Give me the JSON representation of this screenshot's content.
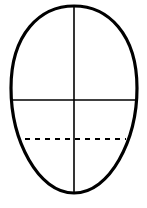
{
  "diagram": {
    "shape": "egg-oval",
    "colors": {
      "stroke": "#000000",
      "background": "#ffffff"
    },
    "outline": {
      "top_y": 6,
      "bottom_y": 193,
      "left_x": 11,
      "right_x": 137,
      "stroke_width": 3.2
    },
    "guides": {
      "vertical_center": {
        "x": 74,
        "style": "solid"
      },
      "horizontal_mid": {
        "y": 100,
        "style": "solid"
      },
      "horizontal_lower": {
        "y": 139,
        "style": "dashed"
      }
    }
  }
}
